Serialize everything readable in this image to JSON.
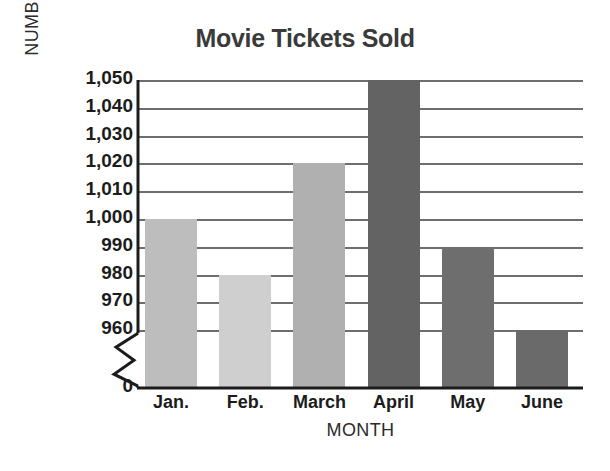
{
  "chart_data": {
    "type": "bar",
    "title": "Movie Tickets Sold",
    "xlabel": "MONTH",
    "ylabel": "NUMBER OF TICKETS",
    "categories": [
      "Jan.",
      "Feb.",
      "March",
      "April",
      "May",
      "June"
    ],
    "values": [
      1000,
      980,
      1020,
      1050,
      990,
      960
    ],
    "ylim": [
      950,
      1050
    ],
    "y_tick_labels": [
      "1,050",
      "1,040",
      "1,030",
      "1,020",
      "1,010",
      "1,000",
      "990",
      "980",
      "970",
      "960",
      "0"
    ],
    "y_tick_values": [
      1050,
      1040,
      1030,
      1020,
      1010,
      1000,
      990,
      980,
      970,
      960,
      0
    ],
    "axis_break": true,
    "axis_break_label": "0",
    "grid": true,
    "legend": "none",
    "bar_colors": [
      "#bdbdbd",
      "#cfcfcf",
      "#b0b0b0",
      "#636363",
      "#6e6e6e",
      "#6a6a6a"
    ],
    "title_color": "#3a3a3a",
    "gridline_color": "#6e6e6e",
    "axis_color": "#1c1c1c"
  }
}
